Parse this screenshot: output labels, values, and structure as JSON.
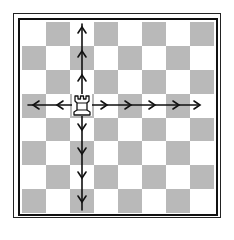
{
  "diagram": {
    "board": {
      "size": 8,
      "top_left_color": "light",
      "colors": {
        "light": "#ffffff",
        "dark": "#b9b9b9",
        "frame": "#111111",
        "arrow": "#111111"
      }
    },
    "piece": {
      "type": "rook",
      "color": "white",
      "col": 2,
      "row": 3,
      "label": "♖"
    },
    "moves": {
      "up": [
        2,
        1,
        0
      ],
      "down": [
        4,
        5,
        6,
        7
      ],
      "left": [
        1,
        0
      ],
      "right": [
        3,
        4,
        5,
        6,
        7
      ]
    }
  }
}
